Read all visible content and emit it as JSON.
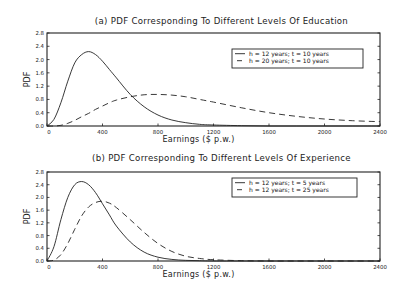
{
  "chart_data": [
    {
      "type": "line",
      "title": "(a) PDF Corresponding To Different Levels Of Education",
      "xlabel": "Earnings ($ p.w.)",
      "ylabel": "PDF",
      "xlim": [
        0,
        2400
      ],
      "ylim": [
        0.0,
        2.8
      ],
      "xticks": [
        "0",
        "400",
        "800",
        "1200",
        "1600",
        "2000",
        "2400"
      ],
      "yticks": [
        "0.0",
        "0.4",
        "0.8",
        "1.2",
        "1.6",
        "2.0",
        "2.4",
        "2.8"
      ],
      "grid": false,
      "legend_position": "upper right",
      "x": [
        0,
        50,
        100,
        150,
        200,
        250,
        300,
        350,
        400,
        450,
        500,
        600,
        700,
        800,
        900,
        1000,
        1100,
        1200,
        1400,
        1600,
        1800,
        2000,
        2200,
        2400
      ],
      "series": [
        {
          "name": "h = 12 years; t = 10 years",
          "style": "solid",
          "values": [
            0.0,
            0.2,
            0.7,
            1.35,
            1.9,
            2.15,
            2.24,
            2.15,
            1.95,
            1.7,
            1.45,
            0.95,
            0.58,
            0.33,
            0.18,
            0.1,
            0.05,
            0.03,
            0.01,
            0.0,
            0.0,
            0.0,
            0.0,
            0.0
          ]
        },
        {
          "name": "h = 20 years; t = 10 years",
          "style": "dashed",
          "values": [
            0.0,
            0.0,
            0.02,
            0.08,
            0.17,
            0.28,
            0.38,
            0.5,
            0.6,
            0.7,
            0.78,
            0.88,
            0.94,
            0.95,
            0.93,
            0.88,
            0.8,
            0.72,
            0.55,
            0.4,
            0.29,
            0.21,
            0.16,
            0.13
          ]
        }
      ]
    },
    {
      "type": "line",
      "title": "(b) PDF Corresponding To Different Levels Of Experience",
      "xlabel": "Earnings ($ p.w.)",
      "ylabel": "PDF",
      "xlim": [
        0,
        2400
      ],
      "ylim": [
        0.0,
        2.8
      ],
      "xticks": [
        "0",
        "400",
        "800",
        "1200",
        "1600",
        "2000",
        "2400"
      ],
      "yticks": [
        "0.0",
        "0.4",
        "0.8",
        "1.2",
        "1.6",
        "2.0",
        "2.4",
        "2.8"
      ],
      "grid": false,
      "legend_position": "upper right",
      "x": [
        0,
        50,
        100,
        150,
        200,
        250,
        300,
        350,
        400,
        450,
        500,
        600,
        700,
        800,
        900,
        1000,
        1100,
        1200,
        1400,
        1600,
        1800,
        2000,
        2200,
        2400
      ],
      "series": [
        {
          "name": "h = 12 years; t = 5 years",
          "style": "solid",
          "values": [
            0.0,
            0.45,
            1.3,
            2.0,
            2.4,
            2.5,
            2.4,
            2.15,
            1.8,
            1.45,
            1.1,
            0.6,
            0.28,
            0.12,
            0.05,
            0.02,
            0.01,
            0.0,
            0.0,
            0.0,
            0.0,
            0.0,
            0.0,
            0.0
          ]
        },
        {
          "name": "h = 12 years; t = 25 years",
          "style": "dashed",
          "values": [
            0.0,
            0.03,
            0.2,
            0.55,
            1.0,
            1.42,
            1.7,
            1.84,
            1.88,
            1.82,
            1.68,
            1.3,
            0.9,
            0.55,
            0.3,
            0.15,
            0.08,
            0.04,
            0.01,
            0.0,
            0.0,
            0.0,
            0.0,
            0.0
          ]
        }
      ]
    }
  ]
}
